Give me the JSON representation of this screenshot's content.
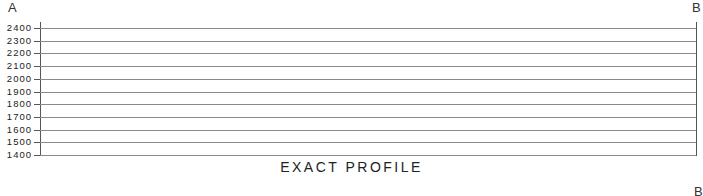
{
  "diagram": {
    "start_label": "A",
    "end_label": "B",
    "title": "EXACT PROFILE",
    "next_end_label": "B"
  },
  "chart_data": {
    "type": "line",
    "title": "EXACT PROFILE",
    "xlabel": "",
    "ylabel": "",
    "x_endpoints": [
      "A",
      "B"
    ],
    "y_ticks": [
      2400,
      2300,
      2200,
      2100,
      2000,
      1900,
      1800,
      1700,
      1600,
      1500,
      1400
    ],
    "ylim": [
      1400,
      2400
    ],
    "grid": true,
    "series": []
  }
}
